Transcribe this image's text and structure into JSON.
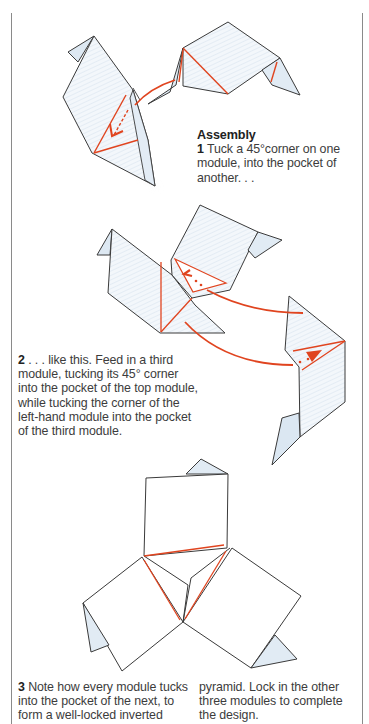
{
  "section": {
    "heading": "Assembly"
  },
  "steps": [
    {
      "number": "1",
      "text": " Tuck a 45°corner on one module, into the pocket of another. . ."
    },
    {
      "number": "2",
      "text": " . . . like this. Feed in a third module, tucking its 45° corner into the pocket of the top module, while tucking the corner of the left-hand module into the pocket of the third module."
    },
    {
      "number": "3",
      "text_col1": " Note how every module tucks into the pocket of the next, to form a well-locked inverted",
      "text_col2": "pyramid. Lock in the other three modules to complete the design."
    }
  ],
  "illustrations": [
    {
      "id": "step-1-diagram",
      "label": "two modules with arrow showing tuck"
    },
    {
      "id": "step-2-diagram",
      "label": "third module fed in with two arrows"
    },
    {
      "id": "step-3-diagram",
      "label": "three modules locked in inverted pyramid"
    }
  ],
  "colors": {
    "line": "#3a3a3a",
    "accent_red": "#e0441f",
    "paper_shade": "#e6eef6",
    "rule": "#8a8a8a"
  }
}
